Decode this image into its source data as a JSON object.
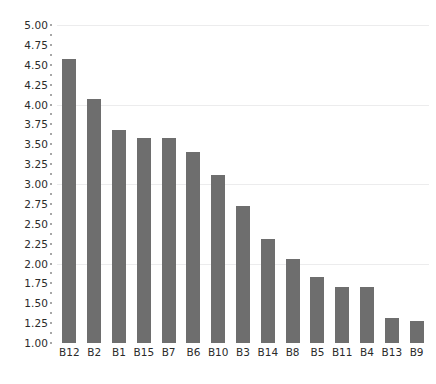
{
  "chart_data": {
    "type": "bar",
    "title": "",
    "subtitle": "",
    "xlabel": "",
    "ylabel": "",
    "categories": [
      "B12",
      "B2",
      "B1",
      "B15",
      "B7",
      "B6",
      "B10",
      "B3",
      "B14",
      "B8",
      "B5",
      "B11",
      "B4",
      "B13",
      "B9"
    ],
    "values": [
      4.57,
      4.07,
      3.68,
      3.58,
      3.58,
      3.4,
      3.11,
      2.72,
      2.31,
      2.06,
      1.83,
      1.7,
      1.7,
      1.32,
      1.28
    ],
    "series": [
      {
        "name": "value",
        "values": [
          4.57,
          4.07,
          3.68,
          3.58,
          3.58,
          3.4,
          3.11,
          2.72,
          2.31,
          2.06,
          1.83,
          1.7,
          1.7,
          1.32,
          1.28
        ]
      }
    ],
    "ylim": [
      1.0,
      5.0
    ],
    "ytick_values": [
      1.0,
      1.25,
      1.5,
      1.75,
      2.0,
      2.25,
      2.5,
      2.75,
      3.0,
      3.25,
      3.5,
      3.75,
      4.0,
      4.25,
      4.5,
      4.75,
      5.0
    ],
    "ytick_labels": [
      "1.00",
      "1.25",
      "1.50",
      "1.75",
      "2.00",
      "2.25",
      "2.50",
      "2.75",
      "3.00",
      "3.25",
      "3.50",
      "3.75",
      "4.00",
      "4.25",
      "4.50",
      "4.75",
      "5.00"
    ],
    "gridlines_at": [
      2.0,
      3.0,
      4.0,
      5.0
    ],
    "grid": true,
    "legend": "none",
    "bar_color": "#6e6e6e",
    "grid_color": "#ececed",
    "tick_color": "#8a8a8a",
    "text_color": "#2b2b2b",
    "background": "#ffffff"
  },
  "footer": {
    "caption": ""
  }
}
